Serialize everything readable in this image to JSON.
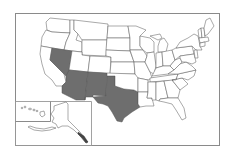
{
  "map": {
    "title": "",
    "region": "United States",
    "highlight_color": "#6e6e6e",
    "base_color": "#ffffff",
    "border_color": "#555555",
    "highlighted_states": [
      "Nevada",
      "Arizona",
      "New Mexico",
      "Texas"
    ],
    "insets": [
      "Hawaii",
      "Alaska"
    ]
  }
}
